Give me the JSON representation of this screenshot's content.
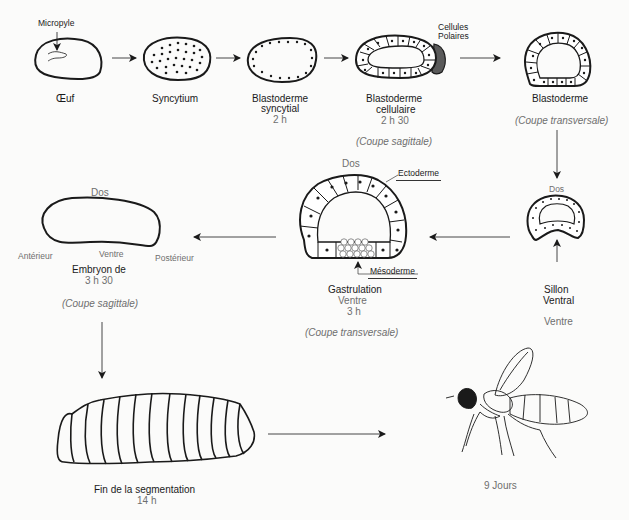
{
  "stages": [
    {
      "name": "Œuf",
      "label_micropyle": "Micropyle"
    },
    {
      "name": "Syncytium"
    },
    {
      "name_line1": "Blastoderme",
      "name_line2": "syncytial",
      "time": "2 h"
    },
    {
      "name_line1": "Blastoderme",
      "name_line2": "cellulaire",
      "time": "2 h 30",
      "section": "(Coupe sagittale)",
      "annotation": "Cellules Polaires",
      "annotation_line1": "Cellules",
      "annotation_line2": "Polaires"
    },
    {
      "name": "Blastoderme",
      "section": "(Coupe transversale)"
    },
    {
      "top": "Dos",
      "name_line1": "Sillon",
      "name_line2": "Ventral",
      "bottom": "Ventre"
    },
    {
      "top": "Dos",
      "name": "Gastrulation",
      "bottom": "Ventre",
      "time": "3 h",
      "section": "(Coupe transversale)",
      "annotation_ecto": "Ectoderme",
      "annotation_meso": "Mésoderme"
    },
    {
      "top": "Dos",
      "anterior": "Antérieur",
      "ventral": "Ventre",
      "posterior": "Postérieur",
      "name": "Embryon de",
      "time": "3 h 30",
      "section": "(Coupe sagittale)"
    },
    {
      "name": "Fin de la segmentation",
      "time": "14 h"
    },
    {
      "name": "9 Jours"
    }
  ],
  "colors": {
    "ink": "#1a1a1a",
    "muted": "#6e6e6e",
    "polar_cells": "#555555",
    "background": "#fbfbfa"
  }
}
